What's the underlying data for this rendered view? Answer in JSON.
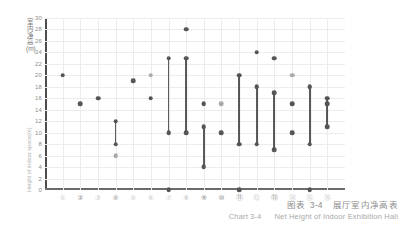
{
  "figure": {
    "caption_cn_prefix": "图表",
    "caption_cn_number": "3-4",
    "caption_cn_title": "展厅室内净高表",
    "caption_en_prefix": "Chart",
    "caption_en_number": "3-4",
    "caption_en_title": "Net Height of Indoor Exhibition Hall"
  },
  "axis": {
    "y_label_cn": "室内净高(m)",
    "y_label_en": "Height of indoor space(m)"
  },
  "chart_data": {
    "type": "scatter",
    "subtitle": "Chart 3-4  Net Height of Indoor Exhibition Hall",
    "xlabel": "",
    "ylabel": "室内净高(m)",
    "ylabel_en": "Height of indoor space(m)",
    "ylim": [
      0,
      30
    ],
    "ytick_step": 2,
    "yticks": [
      0,
      2,
      4,
      6,
      8,
      10,
      12,
      14,
      16,
      18,
      20,
      22,
      24,
      26,
      28,
      30
    ],
    "grid": true,
    "legend": "none",
    "categories": [
      "①",
      "②",
      "③",
      "④",
      "⑤",
      "⑥",
      "⑦",
      "⑧",
      "⑨",
      "⑩",
      "⑪",
      "⑫",
      "⑬",
      "⑭",
      "⑮",
      "⑯"
    ],
    "xtick_emphasis": [
      false,
      true,
      false,
      true,
      false,
      false,
      false,
      false,
      true,
      true,
      true,
      false,
      true,
      false,
      false,
      false
    ],
    "points": [
      {
        "cat": "①",
        "x": 1,
        "values": [
          20
        ],
        "shade": "dark"
      },
      {
        "cat": "②",
        "x": 2,
        "values": [
          15
        ],
        "shade": "dark"
      },
      {
        "cat": "③",
        "x": 3,
        "values": [
          16
        ],
        "shade": "dark"
      },
      {
        "cat": "④",
        "x": 4,
        "values": [
          6
        ],
        "shade": "light"
      },
      {
        "cat": "⑤",
        "x": 5,
        "values": [
          19
        ],
        "shade": "dark"
      },
      {
        "cat": "⑥",
        "x": 6,
        "values": [
          20
        ],
        "shade": "light"
      },
      {
        "cat": "⑥",
        "x": 6,
        "values": [
          16
        ],
        "shade": "dark"
      },
      {
        "cat": "⑦",
        "x": 7,
        "values": [
          0
        ],
        "shade": "dark"
      },
      {
        "cat": "⑧",
        "x": 8,
        "values": [
          28
        ],
        "shade": "dark"
      },
      {
        "cat": "⑨",
        "x": 9,
        "values": [
          15
        ],
        "shade": "dark"
      },
      {
        "cat": "⑩",
        "x": 10,
        "values": [
          15
        ],
        "shade": "light"
      },
      {
        "cat": "⑩",
        "x": 10,
        "values": [
          10
        ],
        "shade": "dark"
      },
      {
        "cat": "⑪",
        "x": 11,
        "values": [
          0
        ],
        "shade": "dark"
      },
      {
        "cat": "⑫",
        "x": 12,
        "values": [
          24
        ],
        "shade": "dark"
      },
      {
        "cat": "⑬",
        "x": 13,
        "values": [
          23
        ],
        "shade": "dark"
      },
      {
        "cat": "⑭",
        "x": 14,
        "values": [
          15
        ],
        "shade": "dark"
      },
      {
        "cat": "⑭",
        "x": 14,
        "values": [
          20
        ],
        "shade": "light"
      },
      {
        "cat": "⑭",
        "x": 14,
        "values": [
          10
        ],
        "shade": "dark"
      },
      {
        "cat": "⑮",
        "x": 15,
        "values": [
          0
        ],
        "shade": "dark"
      },
      {
        "cat": "⑯",
        "x": 16,
        "values": [
          15
        ],
        "shade": "dark"
      }
    ],
    "ranges": [
      {
        "cat": "④",
        "x": 4,
        "min": 8,
        "max": 12
      },
      {
        "cat": "⑦",
        "x": 7,
        "min": 10,
        "max": 23
      },
      {
        "cat": "⑧",
        "x": 8,
        "min": 10,
        "max": 23
      },
      {
        "cat": "⑨",
        "x": 9,
        "min": 4,
        "max": 11
      },
      {
        "cat": "⑪",
        "x": 11,
        "min": 8,
        "max": 20
      },
      {
        "cat": "⑫",
        "x": 12,
        "min": 8,
        "max": 18
      },
      {
        "cat": "⑬",
        "x": 13,
        "min": 7,
        "max": 17
      },
      {
        "cat": "⑮",
        "x": 15,
        "min": 8,
        "max": 18
      },
      {
        "cat": "⑯",
        "x": 16,
        "min": 11,
        "max": 16
      }
    ]
  }
}
